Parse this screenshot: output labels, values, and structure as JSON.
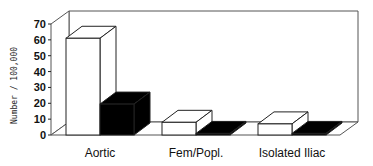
{
  "chart_data": {
    "type": "bar",
    "style": "3d",
    "title": "",
    "xlabel": "",
    "ylabel": "Number / 100,000",
    "ylim": [
      0,
      70
    ],
    "yticks": [
      0,
      10,
      20,
      30,
      40,
      50,
      60,
      70
    ],
    "grid": false,
    "legend": null,
    "categories": [
      "Aortic",
      "Fem/Popl.",
      "Isolated Iliac"
    ],
    "series": [
      {
        "name": "white",
        "color": "#ffffff",
        "values": [
          61,
          8,
          7
        ]
      },
      {
        "name": "black",
        "color": "#000000",
        "values": [
          19.5,
          1,
          1
        ]
      }
    ]
  }
}
